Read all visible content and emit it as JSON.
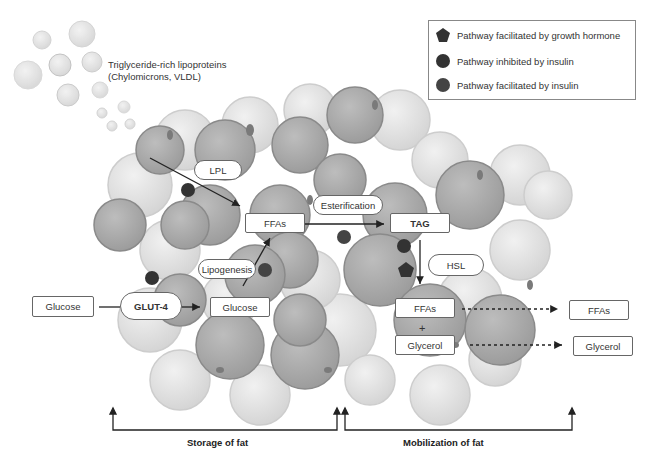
{
  "legend": {
    "items": [
      {
        "icon": "pentagon-icon",
        "label": "Pathway facilitated by growth hormone"
      },
      {
        "icon": "circle-dark-icon",
        "label": "Pathway inhibited by insulin"
      },
      {
        "icon": "circle-medium-icon",
        "label": "Pathway facilitated by insulin"
      }
    ]
  },
  "lipoproteins": {
    "line1": "Triglyceride-rich lipoproteins",
    "line2": "(Chylomicrons, VLDL)"
  },
  "nodes": {
    "lpl": "LPL",
    "ffas_storage": "FFAs",
    "esterification": "Esterification",
    "tag": "TAG",
    "lipogenesis": "Lipogenesis",
    "hsl": "HSL",
    "glucose_outside": "Glucose",
    "glut4": "GLUT-4",
    "glucose_inside": "Glucose",
    "ffas_released": "FFAs",
    "plus": "+",
    "glycerol_released": "Glycerol",
    "ffas_out": "FFAs",
    "glycerol_out": "Glycerol"
  },
  "sections": {
    "storage": "Storage of fat",
    "mobilization": "Mobilization of fat"
  },
  "colors": {
    "cell_fill": "#a9a9a9",
    "cell_stroke": "#8a8a8a",
    "cell_light_fill": "#d9d9d9",
    "marker_dark": "#333333",
    "marker_medium": "#444444",
    "arrow": "#222222"
  }
}
